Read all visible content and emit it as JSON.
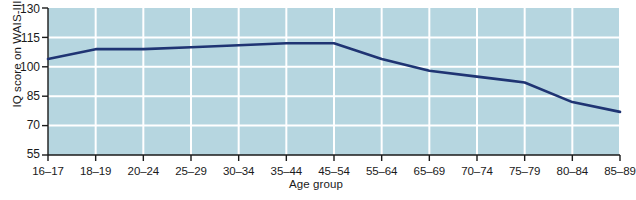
{
  "chart_data": {
    "type": "line",
    "title": "",
    "xlabel": "Age group",
    "ylabel": "IQ score on WAIS-III",
    "categories": [
      "16–17",
      "18–19",
      "20–24",
      "25–29",
      "30–34",
      "35–44",
      "45–54",
      "55–64",
      "65–69",
      "70–74",
      "75–79",
      "80–84",
      "85–89"
    ],
    "values": [
      104,
      109,
      109,
      110,
      111,
      112,
      112,
      104,
      98,
      95,
      92,
      82,
      77
    ],
    "ylim": [
      55,
      130
    ],
    "yticks": [
      130,
      115,
      100,
      85,
      70,
      55
    ],
    "ytick_labels": [
      "130",
      "115",
      "100",
      "85",
      "70",
      "55"
    ],
    "grid": true,
    "grid_color": "#ffffff",
    "legend": "none",
    "series": [
      {
        "name": "IQ score on WAIS-III",
        "color": "#1f3473",
        "values": [
          104,
          109,
          109,
          110,
          111,
          112,
          112,
          104,
          98,
          95,
          92,
          82,
          77
        ]
      }
    ],
    "plot_background": "#b6d6e0",
    "axis_color": "#1a1a1a"
  }
}
